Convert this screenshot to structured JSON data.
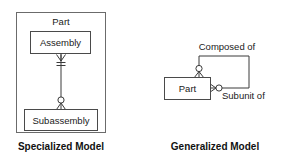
{
  "figure": {
    "title": "",
    "panels": [
      {
        "id": "specialized",
        "caption": "Specialized Model",
        "container_label": "Part",
        "entities": [
          {
            "id": "assembly",
            "label": "Assembly"
          },
          {
            "id": "subassembly",
            "label": "Subassembly"
          }
        ],
        "relationships": [
          {
            "id": "assembly-to-subassembly",
            "label": "",
            "from": "assembly",
            "to": "subassembly",
            "from_cardinality": "many",
            "to_cardinality": "zero-or-many"
          }
        ]
      },
      {
        "id": "generalized",
        "caption": "Generalized Model",
        "container_label": "",
        "entities": [
          {
            "id": "part",
            "label": "Part"
          }
        ],
        "relationships": [
          {
            "id": "composed-of",
            "label": "Composed of",
            "from": "part",
            "to": "part",
            "from_cardinality": "zero-or-many",
            "to_cardinality": "zero-or-many"
          },
          {
            "id": "subunit-of",
            "label": "Subunit of",
            "from": "part",
            "to": "part",
            "from_cardinality": "zero-or-many",
            "to_cardinality": "zero-or-many"
          }
        ]
      }
    ]
  },
  "colors": {
    "background": "#ffffff",
    "box_stroke": "#4a4a4a",
    "outer_stroke": "#6b6b6b",
    "connector": "#3a3a3a",
    "text": "#1a1a1a",
    "caption_text": "#111111"
  }
}
